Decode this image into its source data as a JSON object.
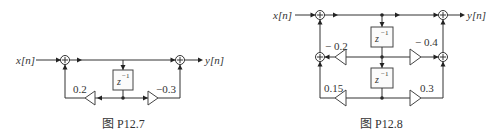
{
  "figures": [
    {
      "caption": "图 P12.7",
      "input_label": "x[n]",
      "output_label": "y[n]",
      "delays": [
        {
          "label": "z",
          "exp": "−1"
        }
      ],
      "gains": [
        {
          "value": "0.2",
          "direction": "left"
        },
        {
          "value": "−0.3",
          "direction": "right"
        }
      ]
    },
    {
      "caption": "图 P12.8",
      "input_label": "x[n]",
      "output_label": "y[n]",
      "delays": [
        {
          "label": "z",
          "exp": "−1"
        },
        {
          "label": "z",
          "exp": "−1"
        }
      ],
      "gains": [
        {
          "value": "− 0.2",
          "direction": "left"
        },
        {
          "value": "− 0.4",
          "direction": "right"
        },
        {
          "value": "0.15",
          "direction": "left"
        },
        {
          "value": "0.3",
          "direction": "right"
        }
      ]
    }
  ]
}
